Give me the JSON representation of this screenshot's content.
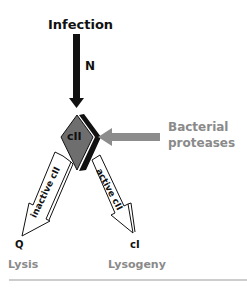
{
  "diagram": {
    "top_label": "Infection",
    "n_label": "N",
    "center_node": "cII",
    "protease_label_line1": "Bacterial",
    "protease_label_line2": "proteases",
    "left_arrow_label": "inactive cII",
    "right_arrow_label": "active cII",
    "left_gene": "Q",
    "right_gene": "cI",
    "left_outcome": "Lysis",
    "right_outcome": "Lysogeny"
  },
  "colors": {
    "dark": "#111111",
    "gray_text": "#8a8a8a",
    "gray_arrow": "#8c8c8c",
    "diamond_fill": "#6e6e6e",
    "rule": "#999999"
  }
}
